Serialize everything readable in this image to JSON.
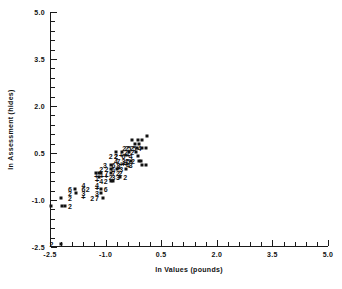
{
  "chart_data": {
    "type": "scatter",
    "title": "",
    "xlabel": "ln Values (pounds)",
    "ylabel": "ln Assessment (hides)",
    "xlim": [
      -2.5,
      5.0
    ],
    "ylim": [
      -2.5,
      5.0
    ],
    "xticks": [
      "-2.5",
      "-1.0",
      "0.5",
      "2.0",
      "3.5",
      "5.0"
    ],
    "xtick_values": [
      -2.5,
      -1.0,
      0.5,
      2.0,
      3.5,
      5.0
    ],
    "yticks": [
      "-2.5",
      "-1.0",
      "0.5",
      "2.0",
      "3.5",
      "5.0"
    ],
    "ytick_values": [
      -2.5,
      -1.0,
      0.5,
      2.0,
      3.5,
      5.0
    ],
    "minor_ticks_per_interval": 5,
    "grid": false,
    "legend": null,
    "marker_color": "#111111",
    "marker_note": "Point labels encode the number of coincident observations; a dot means 1 and a plus means 9 or more.",
    "points": [
      {
        "x": -2.46,
        "y": -2.4,
        "label": "2"
      },
      {
        "x": -2.47,
        "y": -1.18,
        "label": "."
      },
      {
        "x": -2.17,
        "y": -1.18,
        "label": "."
      },
      {
        "x": -2.1,
        "y": -1.18,
        "label": "."
      },
      {
        "x": -1.96,
        "y": -1.18,
        "label": "2"
      },
      {
        "x": -2.19,
        "y": -2.4,
        "label": "."
      },
      {
        "x": -2.21,
        "y": -0.93,
        "label": "."
      },
      {
        "x": -1.96,
        "y": -0.93,
        "label": "2"
      },
      {
        "x": -1.96,
        "y": -0.79,
        "label": "2"
      },
      {
        "x": -1.8,
        "y": -0.79,
        "label": "."
      },
      {
        "x": -1.96,
        "y": -0.66,
        "label": "6"
      },
      {
        "x": -1.83,
        "y": -0.66,
        "label": "."
      },
      {
        "x": -1.6,
        "y": -0.93,
        "label": "+"
      },
      {
        "x": -1.6,
        "y": -0.79,
        "label": "3"
      },
      {
        "x": -1.6,
        "y": -0.66,
        "label": "6"
      },
      {
        "x": -1.48,
        "y": -0.66,
        "label": "2"
      },
      {
        "x": -1.6,
        "y": -0.52,
        "label": "4"
      },
      {
        "x": -1.36,
        "y": -0.93,
        "label": "2"
      },
      {
        "x": -1.23,
        "y": -0.93,
        "label": "7"
      },
      {
        "x": -1.23,
        "y": -0.79,
        "label": "3"
      },
      {
        "x": -1.12,
        "y": -0.79,
        "label": "."
      },
      {
        "x": -1.23,
        "y": -0.66,
        "label": "+"
      },
      {
        "x": -1.12,
        "y": -0.66,
        "label": "."
      },
      {
        "x": -1.0,
        "y": -0.66,
        "label": "6"
      },
      {
        "x": -1.23,
        "y": -0.52,
        "label": "4"
      },
      {
        "x": -1.23,
        "y": -0.39,
        "label": "+"
      },
      {
        "x": -1.12,
        "y": -0.39,
        "label": "4"
      },
      {
        "x": -1.0,
        "y": -0.39,
        "label": "2"
      },
      {
        "x": -0.86,
        "y": -0.39,
        "label": "."
      },
      {
        "x": -0.8,
        "y": -0.39,
        "label": "."
      },
      {
        "x": -1.06,
        "y": -0.93,
        "label": "."
      },
      {
        "x": -1.25,
        "y": -0.26,
        "label": "+"
      },
      {
        "x": -1.18,
        "y": -0.26,
        "label": "."
      },
      {
        "x": -1.1,
        "y": -0.26,
        "label": "+"
      },
      {
        "x": -0.98,
        "y": -0.26,
        "label": "+"
      },
      {
        "x": -0.86,
        "y": -0.26,
        "label": "2"
      },
      {
        "x": -0.79,
        "y": -0.26,
        "label": "3"
      },
      {
        "x": -0.67,
        "y": -0.26,
        "label": "3"
      },
      {
        "x": -0.6,
        "y": -0.26,
        "label": "."
      },
      {
        "x": -0.47,
        "y": -0.26,
        "label": "2"
      },
      {
        "x": -1.25,
        "y": -0.13,
        "label": "."
      },
      {
        "x": -1.19,
        "y": -0.13,
        "label": "."
      },
      {
        "x": -1.12,
        "y": -0.13,
        "label": "."
      },
      {
        "x": -0.98,
        "y": -0.13,
        "label": "7"
      },
      {
        "x": -0.86,
        "y": -0.13,
        "label": "."
      },
      {
        "x": -0.79,
        "y": -0.13,
        "label": "7"
      },
      {
        "x": -0.67,
        "y": -0.13,
        "label": "2"
      },
      {
        "x": -0.6,
        "y": -0.13,
        "label": "2"
      },
      {
        "x": -1.12,
        "y": 0.0,
        "label": "2"
      },
      {
        "x": -0.98,
        "y": 0.0,
        "label": "2"
      },
      {
        "x": -0.86,
        "y": 0.0,
        "label": "."
      },
      {
        "x": -0.8,
        "y": 0.0,
        "label": "6"
      },
      {
        "x": -0.7,
        "y": 0.0,
        "label": "."
      },
      {
        "x": -0.64,
        "y": 0.0,
        "label": "+"
      },
      {
        "x": -0.58,
        "y": 0.0,
        "label": "3"
      },
      {
        "x": -0.44,
        "y": 0.0,
        "label": "."
      },
      {
        "x": -1.02,
        "y": 0.13,
        "label": "3"
      },
      {
        "x": -0.86,
        "y": 0.13,
        "label": "."
      },
      {
        "x": -0.79,
        "y": 0.13,
        "label": "6"
      },
      {
        "x": -0.65,
        "y": 0.13,
        "label": "8"
      },
      {
        "x": -0.58,
        "y": 0.13,
        "label": "+"
      },
      {
        "x": -0.52,
        "y": 0.13,
        "label": "+"
      },
      {
        "x": -0.45,
        "y": 0.13,
        "label": "+"
      },
      {
        "x": -0.39,
        "y": 0.13,
        "label": "4"
      },
      {
        "x": -0.32,
        "y": 0.13,
        "label": "3"
      },
      {
        "x": -0.03,
        "y": 0.13,
        "label": "."
      },
      {
        "x": 0.1,
        "y": 0.13,
        "label": "."
      },
      {
        "x": -0.72,
        "y": 0.26,
        "label": "4"
      },
      {
        "x": -0.65,
        "y": 0.26,
        "label": "7"
      },
      {
        "x": -0.52,
        "y": 0.26,
        "label": "3"
      },
      {
        "x": -0.45,
        "y": 0.26,
        "label": "4"
      },
      {
        "x": -0.39,
        "y": 0.26,
        "label": "5"
      },
      {
        "x": -0.32,
        "y": 0.26,
        "label": "."
      },
      {
        "x": -0.26,
        "y": 0.26,
        "label": "2"
      },
      {
        "x": -0.11,
        "y": 0.26,
        "label": "."
      },
      {
        "x": -0.05,
        "y": 0.26,
        "label": "."
      },
      {
        "x": -0.86,
        "y": 0.39,
        "label": "2"
      },
      {
        "x": -0.72,
        "y": 0.39,
        "label": "2"
      },
      {
        "x": -0.72,
        "y": 0.39,
        "label": "2"
      },
      {
        "x": -0.58,
        "y": 0.39,
        "label": "+"
      },
      {
        "x": -0.52,
        "y": 0.39,
        "label": "6"
      },
      {
        "x": -0.45,
        "y": 0.39,
        "label": "+"
      },
      {
        "x": -0.39,
        "y": 0.39,
        "label": "+"
      },
      {
        "x": -0.32,
        "y": 0.39,
        "label": "4"
      },
      {
        "x": -0.12,
        "y": 0.39,
        "label": "."
      },
      {
        "x": -0.72,
        "y": 0.52,
        "label": "."
      },
      {
        "x": -0.55,
        "y": 0.52,
        "label": "."
      },
      {
        "x": -0.45,
        "y": 0.52,
        "label": "2"
      },
      {
        "x": -0.36,
        "y": 0.52,
        "label": "."
      },
      {
        "x": -0.28,
        "y": 0.52,
        "label": "2"
      },
      {
        "x": -0.18,
        "y": 0.52,
        "label": "."
      },
      {
        "x": -0.5,
        "y": 0.65,
        "label": "2"
      },
      {
        "x": -0.43,
        "y": 0.65,
        "label": "2"
      },
      {
        "x": -0.36,
        "y": 0.65,
        "label": "5"
      },
      {
        "x": -0.29,
        "y": 0.65,
        "label": "2"
      },
      {
        "x": -0.22,
        "y": 0.65,
        "label": "5"
      },
      {
        "x": -0.16,
        "y": 0.65,
        "label": "."
      },
      {
        "x": -0.09,
        "y": 0.65,
        "label": "4"
      },
      {
        "x": -0.01,
        "y": 0.65,
        "label": "."
      },
      {
        "x": 0.1,
        "y": 0.65,
        "label": "."
      },
      {
        "x": -0.22,
        "y": 0.78,
        "label": "."
      },
      {
        "x": -0.09,
        "y": 0.78,
        "label": "."
      },
      {
        "x": -0.3,
        "y": 0.92,
        "label": "."
      },
      {
        "x": -0.12,
        "y": 0.92,
        "label": "."
      },
      {
        "x": -0.01,
        "y": 0.92,
        "label": "."
      },
      {
        "x": 0.13,
        "y": 1.03,
        "label": "."
      }
    ]
  },
  "plot": {
    "x_axis_title": "ln Values (pounds)",
    "y_axis_title": "ln Assessment (hides)"
  }
}
